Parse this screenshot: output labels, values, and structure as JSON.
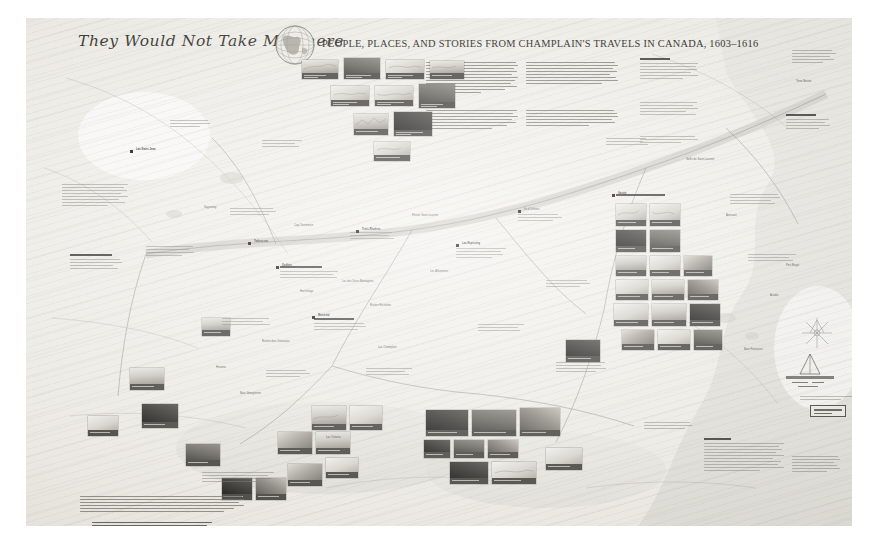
{
  "poster": {
    "title_script": "They Would Not Take Me There",
    "title_subtitle": "PEOPLE, PLACES, AND STORIES FROM CHAMPLAIN'S TRAVELS IN CANADA, 1603–1616",
    "emblem": "globe-hemisphere-emblem",
    "background_color": "#efeeea",
    "ink_color": "#3b3a36",
    "medium": "large-format cartographic poster",
    "orientation": "landscape"
  },
  "intro": {
    "column_1_label": "introduction-text-column",
    "column_2_label": "introduction-text-column",
    "column_3_label": "sidebar-note-column"
  },
  "map": {
    "label": "champlain-travels-basemap",
    "water_color": "#dcdcd6",
    "land_color": "#efeee9",
    "route_color": "#6b6963",
    "markers_visible": 42,
    "place_labels": [
      "Lac Saint-Jean",
      "Tadoussac",
      "Saguenay",
      "Québec",
      "Trois-Rivières",
      "Hochelaga",
      "Montréal",
      "Rivière des Outaouais",
      "Lac Nipissing",
      "Baie Georgienne",
      "Huronia",
      "Lac Ontario",
      "Lac Champlain",
      "Gaspé",
      "Terre-Neuve",
      "Île d'Orléans",
      "Golfe du Saint-Laurent",
      "Fleuve Saint-Laurent",
      "Baie Françoise",
      "Port-Royal",
      "Acadie",
      "Lac des Deux Montagnes",
      "Rivière Richelieu",
      "Les Allumettes",
      "Cap-Tourmente",
      "Anticosti"
    ]
  },
  "tile_clusters": [
    {
      "name": "top-engraving-cluster",
      "count": 10,
      "note": "engraved plates with caption bars"
    },
    {
      "name": "right-portrait-cluster",
      "count": 16,
      "note": "documents and photographs"
    },
    {
      "name": "centre-photo-cluster",
      "count": 14,
      "note": "landscape photographs"
    },
    {
      "name": "lower-left-cluster",
      "count": 9,
      "note": "artefacts and maps"
    }
  ],
  "scale": {
    "label": "scale-and-north-indicator"
  },
  "colophon": {
    "credits_label": "credits-text",
    "references_label": "references-text",
    "imprint_label": "publisher-wordmark"
  }
}
